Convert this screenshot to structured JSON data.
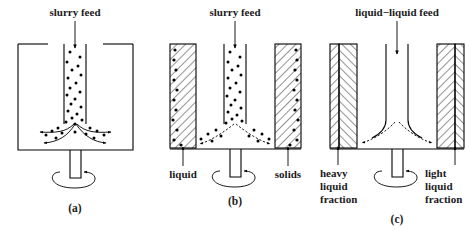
{
  "figure": {
    "title_visible": false,
    "background_color": "#ffffff",
    "line_color": "#000000",
    "panels": [
      {
        "id": "a",
        "caption": "(a)",
        "feed_label": "slurry feed",
        "outlet_labels": [],
        "vessel_type": "open-bowl",
        "has_dots": true,
        "has_hatching": false
      },
      {
        "id": "b",
        "caption": "(b)",
        "feed_label": "slurry feed",
        "outlet_labels": [
          "liquid",
          "solids"
        ],
        "vessel_type": "hatched-walls-with-solids",
        "has_dots": true,
        "has_hatching": true
      },
      {
        "id": "c",
        "caption": "(c)",
        "feed_label": "liquid−liquid feed",
        "outlet_labels": [
          "heavy liquid fraction",
          "light liquid fraction"
        ],
        "outlet_label_lines": [
          [
            "heavy",
            "liquid",
            "fraction"
          ],
          [
            "light",
            "liquid",
            "fraction"
          ]
        ],
        "vessel_type": "split-hatched-walls",
        "has_dots": false,
        "has_hatching": true
      }
    ]
  }
}
